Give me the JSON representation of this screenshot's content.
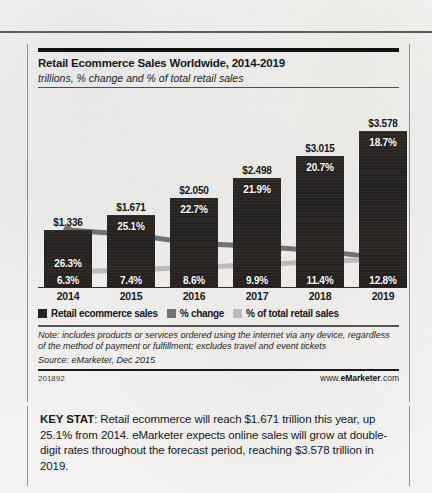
{
  "chart_data": {
    "type": "bar",
    "title": "Retail Ecommerce Sales Worldwide, 2014-2019",
    "subtitle": "trillions, % change and % of total retail sales",
    "categories": [
      "2014",
      "2015",
      "2016",
      "2017",
      "2018",
      "2019"
    ],
    "xlabel": "",
    "ylabel": "",
    "grid": false,
    "legend_position": "bottom",
    "ylim": [
      0,
      3.9
    ],
    "series": [
      {
        "name": "Retail ecommerce sales",
        "type": "bar",
        "unit": "trillions USD",
        "values": [
          1.336,
          1.671,
          2.05,
          2.498,
          3.015,
          3.578
        ],
        "labels": [
          "$1.336",
          "$1.671",
          "$2.050",
          "$2.498",
          "$3.015",
          "$3.578"
        ],
        "color": "#262220"
      },
      {
        "name": "% change",
        "type": "line",
        "unit": "percent",
        "values": [
          26.3,
          25.1,
          22.7,
          21.9,
          20.7,
          18.7
        ],
        "labels": [
          "26.3%",
          "25.1%",
          "22.7%",
          "21.9%",
          "20.7%",
          "18.7%"
        ],
        "color": "#6f7175"
      },
      {
        "name": "% of total retail sales",
        "type": "line",
        "unit": "percent",
        "values": [
          6.3,
          7.4,
          8.6,
          9.9,
          11.4,
          12.8
        ],
        "labels": [
          "6.3%",
          "7.4%",
          "8.6%",
          "9.9%",
          "11.4%",
          "12.8%"
        ],
        "color": "#b9bbbe"
      }
    ],
    "note": "Note: includes products or services ordered using the internet via any device, regardless of the method of payment or fulfillment; excludes travel and event tickets",
    "source": "Source: eMarketer, Dec 2015",
    "chart_id": "201892",
    "brand_prefix": "www.",
    "brand_name": "eMarketer",
    "brand_suffix": ".com"
  },
  "keystat": {
    "label": "KEY STAT",
    "text": ": Retail ecommerce will reach $1.671 trillion this year, up 25.1% from 2014. eMarketer expects online sales will grow at double-digit rates throughout the forecast period, reaching $3.578 trillion in 2019."
  }
}
